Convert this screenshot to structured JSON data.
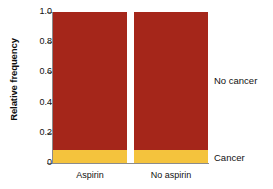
{
  "chart_data": {
    "type": "bar",
    "title": "",
    "subtitle": "",
    "xlabel": "",
    "ylabel": "Relative frequency",
    "categories": [
      "Aspirin",
      "No aspirin"
    ],
    "series": [
      {
        "name": "Cancer",
        "values": [
          0.086,
          0.086
        ],
        "color": "#f4c33d"
      },
      {
        "name": "No cancer",
        "values": [
          0.914,
          0.914
        ],
        "color": "#a5261a"
      }
    ],
    "stacked": true,
    "ylim": [
      0,
      1.0
    ],
    "y_ticks": [
      {
        "value": 1.0,
        "label": "1.0"
      },
      {
        "value": 0.8,
        "label": "0.8"
      },
      {
        "value": 0.6,
        "label": "0.6"
      },
      {
        "value": 0.4,
        "label": "0.4"
      },
      {
        "value": 0.2,
        "label": "0.2"
      },
      {
        "value": 0.0,
        "label": "0"
      }
    ],
    "grid": false,
    "legend_position": "right-inline",
    "annotations": [
      {
        "text": "No cancer",
        "anchor_series": "No cancer"
      },
      {
        "text": "Cancer",
        "anchor_series": "Cancer"
      }
    ]
  },
  "axis": {
    "y_title": "Relative frequency",
    "tick_labels": [
      "1.0",
      "0.8",
      "0.6",
      "0.4",
      "0.2",
      "0"
    ],
    "category_labels": [
      "Aspirin",
      "No aspirin"
    ]
  },
  "legend": {
    "no_cancer_label": "No cancer",
    "cancer_label": "Cancer"
  },
  "colors": {
    "no_cancer": "#a5261a",
    "cancer": "#f4c33d",
    "axis": "#8b8b8b",
    "text": "#111111",
    "background": "#ffffff"
  }
}
